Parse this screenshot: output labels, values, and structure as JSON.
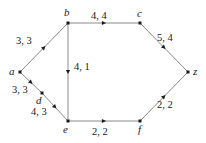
{
  "figure": {
    "background_color": "#ffffff",
    "edge_color": "#8a8a8a",
    "node_color": "#1a1a1a",
    "text_color": "#1a1a1a"
  },
  "nodes": [
    {
      "id": "a",
      "label": "a",
      "x": 20,
      "y": 72,
      "label_x": 9,
      "label_y": 66
    },
    {
      "id": "b",
      "label": "b",
      "x": 68,
      "y": 23,
      "label_x": 64,
      "label_y": 7
    },
    {
      "id": "c",
      "label": "c",
      "x": 140,
      "y": 23,
      "label_x": 137,
      "label_y": 8
    },
    {
      "id": "d",
      "label": "d",
      "x": 42,
      "y": 93,
      "label_x": 36,
      "label_y": 95
    },
    {
      "id": "e",
      "label": "e",
      "x": 68,
      "y": 121,
      "label_x": 63,
      "label_y": 124
    },
    {
      "id": "f",
      "label": "f",
      "x": 140,
      "y": 121,
      "label_x": 138,
      "label_y": 124
    },
    {
      "id": "z",
      "label": "z",
      "x": 188,
      "y": 72,
      "label_x": 193,
      "label_y": 66
    }
  ],
  "edges": [
    {
      "id": "a-b",
      "from": "a",
      "to": "b",
      "capacity": 3,
      "flow": 3,
      "label": "3, 3",
      "label_x": 16,
      "label_y": 36
    },
    {
      "id": "b-c",
      "from": "b",
      "to": "c",
      "capacity": 4,
      "flow": 4,
      "label": "4, 4",
      "label_x": 91,
      "label_y": 11
    },
    {
      "id": "c-z",
      "from": "c",
      "to": "z",
      "capacity": 5,
      "flow": 4,
      "label": "5, 4",
      "label_x": 157,
      "label_y": 33
    },
    {
      "id": "b-e",
      "from": "b",
      "to": "e",
      "capacity": 4,
      "flow": 1,
      "label": "4, 1",
      "label_x": 74,
      "label_y": 62
    },
    {
      "id": "a-d",
      "from": "a",
      "to": "d",
      "capacity": 3,
      "flow": 3,
      "label": "3, 3",
      "label_x": 12,
      "label_y": 85
    },
    {
      "id": "d-e",
      "from": "d",
      "to": "e",
      "capacity": 4,
      "flow": 3,
      "label": "4, 3",
      "label_x": 31,
      "label_y": 107
    },
    {
      "id": "e-f",
      "from": "e",
      "to": "f",
      "capacity": 2,
      "flow": 2,
      "label": "2, 2",
      "label_x": 92,
      "label_y": 127
    },
    {
      "id": "f-z",
      "from": "f",
      "to": "z",
      "capacity": 2,
      "flow": 2,
      "label": "2, 2",
      "label_x": 157,
      "label_y": 100
    }
  ],
  "chart_data": {
    "type": "diagram",
    "diagram_kind": "directed flow network",
    "title": "",
    "vertices": [
      "a",
      "b",
      "c",
      "d",
      "e",
      "f",
      "z"
    ],
    "source": "a",
    "sink": "z",
    "edge_label_format": "capacity, flow",
    "edges": [
      {
        "from": "a",
        "to": "b",
        "capacity": 3,
        "flow": 3,
        "label": "3, 3"
      },
      {
        "from": "a",
        "to": "d",
        "capacity": 3,
        "flow": 3,
        "label": "3, 3"
      },
      {
        "from": "b",
        "to": "c",
        "capacity": 4,
        "flow": 4,
        "label": "4, 4"
      },
      {
        "from": "b",
        "to": "e",
        "capacity": 4,
        "flow": 1,
        "label": "4, 1"
      },
      {
        "from": "d",
        "to": "e",
        "capacity": 4,
        "flow": 3,
        "label": "4, 3"
      },
      {
        "from": "c",
        "to": "z",
        "capacity": 5,
        "flow": 4,
        "label": "5, 4"
      },
      {
        "from": "e",
        "to": "f",
        "capacity": 2,
        "flow": 2,
        "label": "2, 2"
      },
      {
        "from": "f",
        "to": "z",
        "capacity": 2,
        "flow": 2,
        "label": "2, 2"
      }
    ],
    "legend": [],
    "grid": false
  }
}
